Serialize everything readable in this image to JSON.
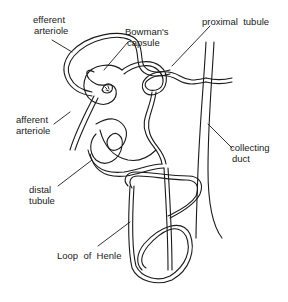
{
  "diagram": {
    "labels": {
      "efferent_arteriole": [
        "efferent",
        "arteriole"
      ],
      "bowmans_capsule": [
        "Bowman's",
        "capsule"
      ],
      "proximal_tubule": [
        "proximal  tubule"
      ],
      "afferent_arteriole": [
        "afferent",
        "arteriole"
      ],
      "collecting_duct": [
        "collecting",
        "duct"
      ],
      "distal_tubule": [
        "distal",
        "tubule"
      ],
      "loop_of_henle": [
        "Loop  of  Henle"
      ]
    },
    "colors": {
      "stroke": "#1a1a1a",
      "background": "#ffffff"
    }
  }
}
